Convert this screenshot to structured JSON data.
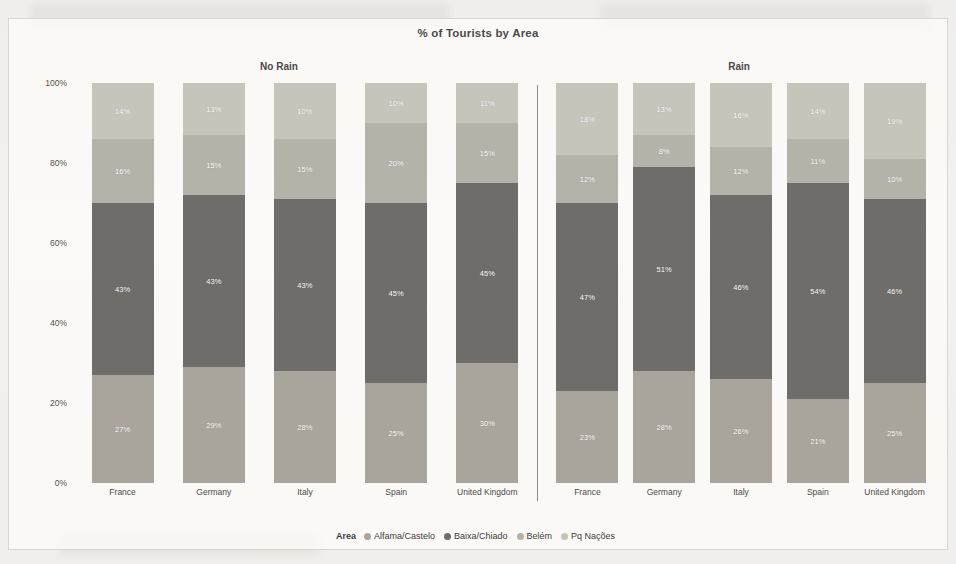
{
  "chart_data": {
    "type": "bar",
    "stacked": true,
    "normalized_percent": true,
    "title": "% of Tourists by Area",
    "xlabel": "",
    "ylabel": "",
    "ylim": [
      0,
      100
    ],
    "ytick_labels": [
      "0%",
      "20%",
      "40%",
      "60%",
      "80%",
      "100%"
    ],
    "ytick_values": [
      0,
      20,
      40,
      60,
      80,
      100
    ],
    "grid": false,
    "legend_title": "Area",
    "legend_position": "bottom",
    "legend": [
      "Alfama/Castelo",
      "Baixa/Chiado",
      "Belém",
      "Pq Nações"
    ],
    "series_colors": [
      "#a9a59c",
      "#6e6d69",
      "#b5b2aa",
      "#c7c4bc"
    ],
    "panels": [
      {
        "name": "No Rain",
        "categories": [
          "France",
          "Germany",
          "Italy",
          "Spain",
          "United Kingdom"
        ],
        "series": [
          {
            "name": "Alfama/Castelo",
            "values": [
              27,
              29,
              28,
              25,
              30
            ],
            "labels": [
              "27%",
              "29%",
              "28%",
              "25%",
              "30%"
            ]
          },
          {
            "name": "Baixa/Chiado",
            "values": [
              43,
              43,
              43,
              45,
              45
            ],
            "labels": [
              "43%",
              "43%",
              "43%",
              "45%",
              "45%"
            ]
          },
          {
            "name": "Belém",
            "values": [
              16,
              15,
              15,
              20,
              15
            ],
            "labels": [
              "16%",
              "15%",
              "15%",
              "20%",
              "15%"
            ]
          },
          {
            "name": "Pq Nações",
            "values": [
              14,
              13,
              14,
              10,
              10
            ],
            "labels": [
              "14%",
              "13%",
              "10%",
              "10%",
              "11%"
            ]
          }
        ]
      },
      {
        "name": "Rain",
        "categories": [
          "France",
          "Germany",
          "Italy",
          "Spain",
          "United Kingdom"
        ],
        "series": [
          {
            "name": "Alfama/Castelo",
            "values": [
              23,
              28,
              26,
              21,
              25
            ],
            "labels": [
              "23%",
              "28%",
              "26%",
              "21%",
              "25%"
            ]
          },
          {
            "name": "Baixa/Chiado",
            "values": [
              47,
              51,
              46,
              54,
              46
            ],
            "labels": [
              "47%",
              "51%",
              "46%",
              "54%",
              "46%"
            ]
          },
          {
            "name": "Belém",
            "values": [
              12,
              8,
              12,
              11,
              10
            ],
            "labels": [
              "12%",
              "8%",
              "12%",
              "11%",
              "10%"
            ]
          },
          {
            "name": "Pq Nações",
            "values": [
              18,
              13,
              16,
              14,
              19
            ],
            "labels": [
              "18%",
              "13%",
              "16%",
              "14%",
              "19%"
            ]
          }
        ]
      }
    ]
  }
}
